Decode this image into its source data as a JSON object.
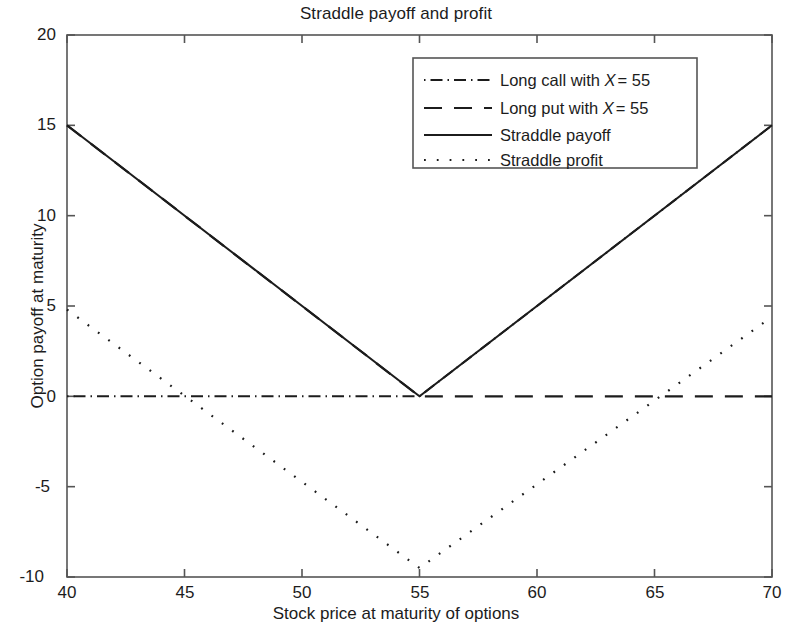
{
  "chart_data": {
    "type": "line",
    "title": "Straddle payoff and profit",
    "xlabel": "Stock price at maturity of options",
    "ylabel": "Option payoff at maturity",
    "xlim": [
      40,
      70
    ],
    "ylim": [
      -10,
      20
    ],
    "xticks": [
      40,
      45,
      50,
      55,
      60,
      65,
      70
    ],
    "yticks": [
      -10,
      -5,
      0,
      5,
      10,
      15,
      20
    ],
    "grid": false,
    "legend_position": "upper center",
    "strike": 55,
    "straddle_premium": 10.2,
    "series": [
      {
        "name": "Long call with X = 55",
        "legend_label": "Long call with ",
        "legend_var": "X",
        "legend_value": "= 55",
        "style": "dashdot",
        "x": [
          40,
          55,
          70
        ],
        "y": [
          0,
          0,
          15
        ]
      },
      {
        "name": "Long put with X = 55",
        "legend_label": "Long put with ",
        "legend_var": "X",
        "legend_value": "= 55",
        "style": "dashed",
        "x": [
          40,
          55,
          70
        ],
        "y": [
          15,
          0,
          0
        ]
      },
      {
        "name": "Straddle payoff",
        "legend_label": "Straddle payoff",
        "legend_var": "",
        "legend_value": "",
        "style": "solid",
        "x": [
          40,
          55,
          70
        ],
        "y": [
          15,
          0,
          15
        ]
      },
      {
        "name": "Straddle profit",
        "legend_label": "Straddle profit",
        "legend_var": "",
        "legend_value": "",
        "style": "dotted",
        "x": [
          40,
          55,
          70
        ],
        "y": [
          4.8,
          -9.5,
          4.4
        ]
      }
    ]
  },
  "axes": {
    "title": "Straddle payoff and profit",
    "xlabel": "Stock price at maturity of options",
    "ylabel": "Option payoff at maturity",
    "yticks": [
      "20",
      "15",
      "10",
      "5",
      "0",
      "-5",
      "-10"
    ],
    "xticks": [
      "40",
      "45",
      "50",
      "55",
      "60",
      "65",
      "70"
    ]
  },
  "legend": {
    "items": [
      {
        "label": "Long call with ",
        "var": "X",
        "value": "= 55",
        "style": "dashdot"
      },
      {
        "label": "Long put with ",
        "var": "X",
        "value": "= 55",
        "style": "dashed"
      },
      {
        "label": "Straddle payoff",
        "var": "",
        "value": "",
        "style": "solid"
      },
      {
        "label": "Straddle profit",
        "var": "",
        "value": "",
        "style": "dotted"
      }
    ]
  },
  "colors": {
    "line": "#1c1c1c",
    "axis": "#555555",
    "background": "#ffffff"
  }
}
